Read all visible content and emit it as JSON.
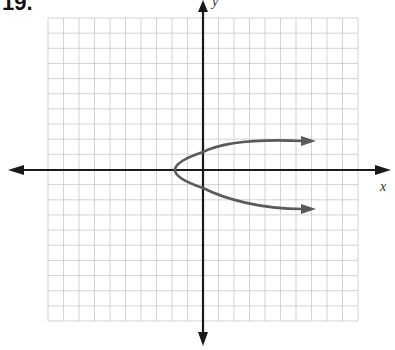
{
  "problem": {
    "number": "19."
  },
  "axes": {
    "x_label": "x",
    "y_label": "y"
  },
  "colors": {
    "grid": "#c8c8c8",
    "axis": "#1a1a1a",
    "curve": "#5a5a5a",
    "background": "#ffffff"
  },
  "grid": {
    "cols": 20,
    "rows": 20,
    "left": 48,
    "top": 18,
    "right": 358,
    "bottom": 321
  },
  "chart_data": {
    "type": "line",
    "title": "",
    "xlabel": "x",
    "ylabel": "y",
    "grid": true,
    "xlim": [
      -10,
      10
    ],
    "ylim": [
      -10,
      10
    ],
    "series": [
      {
        "name": "parabola",
        "points": [
          [
            -2,
            0
          ],
          [
            -1.5,
            0.7
          ],
          [
            0,
            1.4
          ],
          [
            2,
            2
          ],
          [
            4,
            2.3
          ],
          [
            6,
            2.5
          ],
          [
            7,
            2.5
          ]
        ]
      },
      {
        "name": "parabola-lower",
        "points": [
          [
            -2,
            0
          ],
          [
            -1.5,
            -0.7
          ],
          [
            0,
            -1.4
          ],
          [
            2,
            -2
          ],
          [
            4,
            -2.3
          ],
          [
            6,
            -2.6
          ],
          [
            7,
            -2.6
          ]
        ]
      }
    ],
    "vertex": [
      -2,
      0
    ]
  }
}
